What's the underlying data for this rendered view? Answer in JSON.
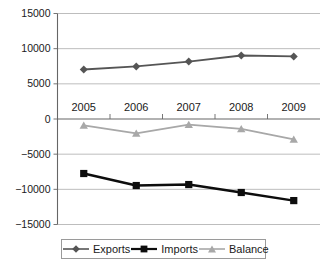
{
  "chart_data": {
    "type": "line",
    "title": "",
    "xlabel": "",
    "ylabel": "",
    "categories": [
      "2005",
      "2006",
      "2007",
      "2008",
      "2009"
    ],
    "ylim": [
      -15000,
      15000
    ],
    "ytick_labels": [
      "15000",
      "10000",
      "5000",
      "0",
      "−5000",
      "−10000",
      "−15000"
    ],
    "ytick_values": [
      15000,
      10000,
      5000,
      0,
      -5000,
      -10000,
      -15000
    ],
    "grid": true,
    "legend_position": "bottom",
    "series": [
      {
        "name": "Exports",
        "color": "#555555",
        "marker": "diamond",
        "values": [
          7040,
          7470,
          8170,
          9030,
          8890
        ]
      },
      {
        "name": "Imports",
        "color": "#0d0d0d",
        "marker": "square",
        "values": [
          -7750,
          -9460,
          -9320,
          -10450,
          -11600
        ]
      },
      {
        "name": "Balance",
        "color": "#a8a8a8",
        "marker": "triangle",
        "values": [
          -900,
          -2050,
          -800,
          -1400,
          -2900
        ]
      }
    ]
  },
  "axis": {
    "line_color": "#666666",
    "grid_color": "#b5b5b5"
  },
  "legend": {
    "items": [
      {
        "label": "Exports"
      },
      {
        "label": "Imports"
      },
      {
        "label": "Balance"
      }
    ]
  }
}
